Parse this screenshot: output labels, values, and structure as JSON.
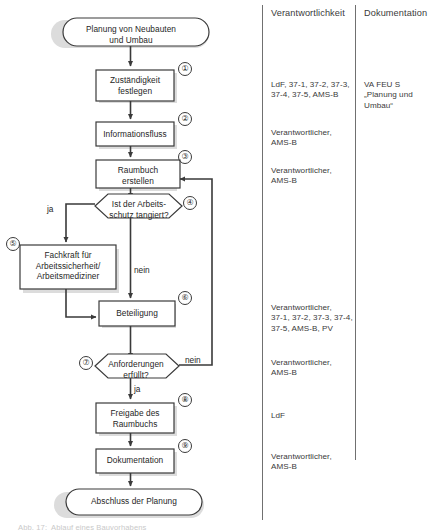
{
  "columns": {
    "responsibility_header": "Verantwortlichkeit",
    "documentation_header": "Dokumentation"
  },
  "nodes": {
    "start": {
      "label": "Planung von Neubauten\nund Umbau",
      "shape": "terminator"
    },
    "n1": {
      "number": "①",
      "label": "Zuständigkeit\nfestlegen",
      "shape": "process"
    },
    "n2": {
      "number": "②",
      "label": "Informationsfluss",
      "shape": "process"
    },
    "n3": {
      "number": "③",
      "label": "Raumbuch\nerstellen",
      "shape": "process"
    },
    "n4": {
      "number": "④",
      "label": "Ist der Arbeits-\nschutz tangiert?",
      "shape": "decision"
    },
    "n5": {
      "number": "⑤",
      "label": "Fachkraft für\nArbeitssicherheit/\nArbeitsmediziner",
      "shape": "process"
    },
    "n6": {
      "number": "⑥",
      "label": "Beteiligung",
      "shape": "process"
    },
    "n7": {
      "number": "⑦",
      "label": "Anforderungen\nerfüllt?",
      "shape": "decision"
    },
    "n8": {
      "number": "⑧",
      "label": "Freigabe des\nRaumbuchs",
      "shape": "process"
    },
    "n9": {
      "number": "⑨",
      "label": "Dokumentation",
      "shape": "process"
    },
    "end": {
      "label": "Abschluss der Planung",
      "shape": "terminator"
    }
  },
  "edge_labels": {
    "d4_yes": "ja",
    "d4_no": "nein",
    "d7_no": "nein",
    "d7_yes": "ja"
  },
  "responsibility_rows": {
    "r1": "LdF, 37-1, 37-2, 37-3,\n37-4, 37-5, AMS-B",
    "r2": "Verantwortlicher,\nAMS-B",
    "r3": "Verantwortlicher,\nAMS-B",
    "r6": "Verantwortlicher,\n37-1, 37-2, 37-3, 37-4,\n37-5, AMS-B, PV",
    "r7": "Verantwortlicher,\nAMS-B",
    "r8": "LdF",
    "r9": "Verantwortlicher,\nAMS-B"
  },
  "documentation_rows": {
    "d1": "VA FEU S\n„Planung und\nUmbau“"
  },
  "footer": {
    "caption": "Abb. 17:  Ablauf eines Bauvorhabens"
  },
  "colors": {
    "stroke": "#3a3a3a",
    "shadow": "#d9d9d9",
    "text": "#2b2b2b",
    "divider": "#707070"
  }
}
